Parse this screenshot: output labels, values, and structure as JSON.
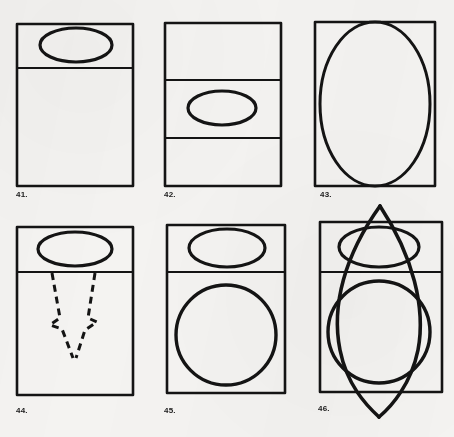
{
  "page": {
    "background_color": "#f4f3f1",
    "ink_color": "#141414",
    "width": 454,
    "height": 437
  },
  "labels": {
    "p41": "41.",
    "p42": "42.",
    "p43": "43.",
    "p44": "44.",
    "p45": "45.",
    "p46": "46."
  },
  "label_positions": [
    {
      "id": "p41",
      "x": 16,
      "y": 190
    },
    {
      "id": "p42",
      "x": 164,
      "y": 190
    },
    {
      "id": "p43",
      "x": 320,
      "y": 190
    },
    {
      "id": "p44",
      "x": 16,
      "y": 406
    },
    {
      "id": "p45",
      "x": 164,
      "y": 406
    },
    {
      "id": "p46",
      "x": 318,
      "y": 404
    }
  ],
  "figures": {
    "f41": {
      "name": "rectangle-with-top-band-and-ellipse",
      "rect": {
        "x": 17,
        "y": 24,
        "w": 116,
        "h": 162
      },
      "dividers": [
        {
          "y": 68
        }
      ],
      "ellipses": [
        {
          "cx": 76,
          "cy": 45,
          "rx": 36,
          "ry": 17
        }
      ]
    },
    "f42": {
      "name": "rectangle-with-two-dividers-and-middle-ellipse",
      "rect": {
        "x": 165,
        "y": 23,
        "w": 116,
        "h": 163
      },
      "dividers": [
        {
          "y": 80
        },
        {
          "y": 138
        }
      ],
      "ellipses": [
        {
          "cx": 222,
          "cy": 108,
          "rx": 34,
          "ry": 17
        }
      ]
    },
    "f43": {
      "name": "rectangle-with-large-inscribed-ellipse",
      "rect": {
        "x": 315,
        "y": 22,
        "w": 120,
        "h": 164
      },
      "dividers": [],
      "ellipses": [
        {
          "cx": 375,
          "cy": 104,
          "rx": 55,
          "ry": 82
        }
      ]
    },
    "f44": {
      "name": "rectangle-with-ellipse-and-dashed-arrow",
      "rect": {
        "x": 17,
        "y": 227,
        "w": 116,
        "h": 168
      },
      "dividers": [
        {
          "y": 272
        }
      ],
      "ellipses": [
        {
          "cx": 75,
          "cy": 249,
          "rx": 37,
          "ry": 17
        }
      ],
      "dashed_arrow": {
        "left_path": "M 52 273 L 60 318 L 50 325 L 62 329 L 73 358",
        "right_path": "M 95 273 L 88 318 L 97 322 L 85 330 L 76 358"
      }
    },
    "f45": {
      "name": "rectangle-with-top-ellipse-and-bottom-circle",
      "rect": {
        "x": 167,
        "y": 225,
        "w": 118,
        "h": 168
      },
      "dividers": [
        {
          "y": 272
        }
      ],
      "ellipses": [
        {
          "cx": 227,
          "cy": 248,
          "rx": 38,
          "ry": 19
        }
      ],
      "circles": [
        {
          "cx": 226,
          "cy": 335,
          "r": 50
        }
      ]
    },
    "f46": {
      "name": "rectangle-ellipse-circle-overlaid-with-pointed-lens",
      "rect": {
        "x": 320,
        "y": 222,
        "w": 122,
        "h": 170
      },
      "dividers": [
        {
          "y": 272
        }
      ],
      "ellipses": [
        {
          "cx": 379,
          "cy": 247,
          "rx": 40,
          "ry": 20
        }
      ],
      "circles": [
        {
          "cx": 379,
          "cy": 332,
          "r": 51
        }
      ],
      "lens": {
        "apex_top": {
          "x": 380,
          "y": 206
        },
        "apex_bottom": {
          "x": 379,
          "y": 417
        },
        "left_path": "M 380 206 C 345 255 331 305 340 350 C 347 385 366 405 379 417",
        "right_path": "M 380 206 C 413 256 426 308 418 350 C 411 384 392 406 379 417"
      }
    }
  }
}
